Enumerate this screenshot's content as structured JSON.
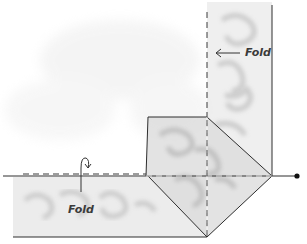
{
  "diagram": {
    "labels": {
      "top_fold": "Fold",
      "bottom_fold": "Fold"
    },
    "colors": {
      "line": "#2e2e2e",
      "fabric_shade": "#cfcfcf",
      "fabric_light": "#e4e4e4",
      "background": "#ffffff",
      "dot": "#111111"
    }
  }
}
